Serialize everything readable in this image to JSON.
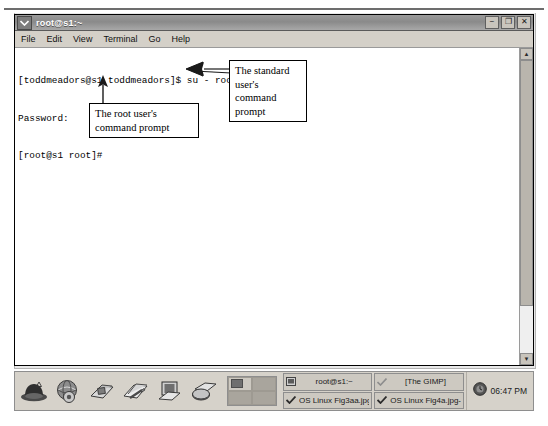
{
  "window": {
    "title": "root@s1:~",
    "menu_button_icon": "window-menu-chevron-icon",
    "controls": {
      "minimize": "−",
      "maximize": "❐",
      "close": "✕"
    },
    "menus": [
      {
        "label": "File",
        "mnemonic": "F"
      },
      {
        "label": "Edit",
        "mnemonic": "E"
      },
      {
        "label": "View",
        "mnemonic": "V"
      },
      {
        "label": "Terminal",
        "mnemonic": "T"
      },
      {
        "label": "Go",
        "mnemonic": "G"
      },
      {
        "label": "Help",
        "mnemonic": "H"
      }
    ]
  },
  "terminal": {
    "lines": [
      "[toddmeadors@s1 toddmeadors]$ su - root",
      "Password:",
      "[root@s1 root]#"
    ],
    "scrollbar": {
      "up_arrow": "▲",
      "down_arrow": "▼"
    }
  },
  "annotations": [
    {
      "id": "standard-user-prompt",
      "text": "The standard user's command prompt"
    },
    {
      "id": "root-user-prompt",
      "text": "The root user's command prompt"
    }
  ],
  "panel": {
    "launchers": [
      {
        "name": "red-hat-menu-icon",
        "label": "Main Menu"
      },
      {
        "name": "web-browser-icon",
        "label": "Web Browser"
      },
      {
        "name": "email-icon",
        "label": "Email"
      },
      {
        "name": "word-processor-icon",
        "label": "Word Processor"
      },
      {
        "name": "presentation-icon",
        "label": "Presentation"
      },
      {
        "name": "spreadsheet-icon",
        "label": "Spreadsheet"
      }
    ],
    "workspaces": {
      "count": 4,
      "active_index": 0
    },
    "tasks": [
      {
        "label": "root@s1:~",
        "icon": "terminal-icon",
        "active": true
      },
      {
        "label": "[The GIMP]",
        "icon": "check-icon",
        "active": false
      },
      {
        "label": "OS Linux Fig3aa.jpg-0.",
        "icon": "check-icon",
        "active": false
      },
      {
        "label": "OS Linux Fig4a.jpg-1.0",
        "icon": "check-icon",
        "active": false
      }
    ],
    "clock": "06:47 PM",
    "clock_icon": "clock-icon"
  }
}
